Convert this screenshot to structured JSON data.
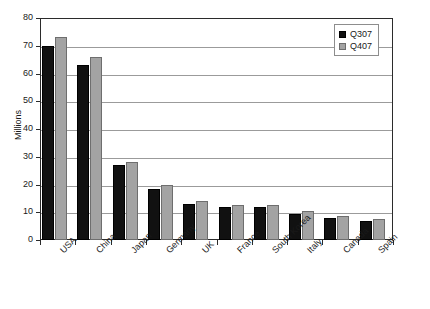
{
  "chart_data": {
    "type": "bar",
    "title": "",
    "subtitle": "",
    "xlabel": "",
    "ylabel": "Millions",
    "ylim": [
      0,
      80
    ],
    "ytick_step": 10,
    "yticks": [
      80,
      70,
      60,
      50,
      40,
      30,
      20,
      10,
      0
    ],
    "grid": true,
    "grid_axis": "y",
    "legend_position": "top-right-inside",
    "xtick_label_rotation": -45,
    "categories": [
      "USA",
      "China",
      "Japan",
      "Germany",
      "UK",
      "France",
      "South Korea",
      "Italy",
      "Canada",
      "Spain"
    ],
    "series": [
      {
        "name": "Q307",
        "color": "#111111",
        "values": [
          70,
          63,
          27,
          18.5,
          13,
          12,
          12,
          9.5,
          8,
          7
        ]
      },
      {
        "name": "Q407",
        "color": "#a3a3a3",
        "values": [
          73,
          66,
          28,
          20,
          14,
          12.5,
          12.5,
          10.5,
          8.5,
          7.5
        ]
      }
    ]
  },
  "legend": {
    "entries": [
      {
        "label": "Q307",
        "swatch": "black-square-icon"
      },
      {
        "label": "Q407",
        "swatch": "gray-square-icon"
      }
    ]
  },
  "axes": {
    "y_title": "Millions"
  },
  "colors": {
    "series_q307": "#111111",
    "series_q407": "#a3a3a3",
    "axis": "#2b2b2b",
    "gridline": "#9b9b9b",
    "background": "#ffffff"
  }
}
